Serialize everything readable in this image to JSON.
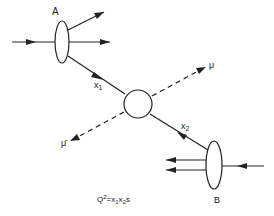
{
  "diagram": {
    "labels": {
      "hadron_a": "A",
      "hadron_b": "B",
      "parton_1": "x",
      "parton_1_sub": "1",
      "parton_2": "x",
      "parton_2_sub": "2",
      "muon": "μ",
      "antimuon": "μ̄",
      "formula_q": "Q",
      "formula_exp": "2",
      "formula_eq": "=x",
      "formula_sub1": "1",
      "formula_x2": "x",
      "formula_sub2": "2",
      "formula_s": "s"
    },
    "colors": {
      "line": "#222222",
      "background": "#ffffff"
    }
  }
}
